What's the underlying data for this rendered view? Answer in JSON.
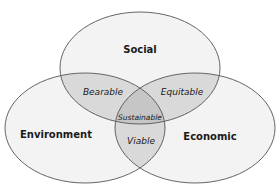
{
  "diagram": {
    "type": "venn",
    "sets": [
      {
        "id": "social",
        "label": "Social",
        "cx": 140,
        "cy": 68,
        "rx": 80,
        "ry": 56
      },
      {
        "id": "environment",
        "label": "Environment",
        "cx": 85,
        "cy": 128,
        "rx": 80,
        "ry": 55
      },
      {
        "id": "economic",
        "label": "Economic",
        "cx": 195,
        "cy": 128,
        "rx": 80,
        "ry": 55
      }
    ],
    "intersections": {
      "social_environment": "Bearable",
      "social_economic": "Equitable",
      "environment_economic": "Viable",
      "all": "Sustainable"
    },
    "colors": {
      "background": "#ffffff",
      "fill": "#f3f3f3",
      "overlap_two": "#d9d9d9",
      "overlap_three": "#c6c6c6",
      "stroke": "#555555",
      "text": "#1a1a1a"
    }
  }
}
